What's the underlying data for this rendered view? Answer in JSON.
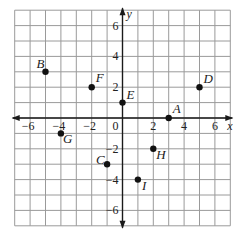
{
  "chart_data": {
    "type": "scatter",
    "title": "",
    "xlabel": "x",
    "ylabel": "y",
    "xlim": [
      -7,
      7
    ],
    "ylim": [
      -7,
      7
    ],
    "grid": true,
    "x_ticks": [
      -6,
      -4,
      -2,
      0,
      2,
      4,
      6
    ],
    "y_ticks": [
      6,
      4,
      2,
      -2,
      -4,
      -6
    ],
    "points": [
      {
        "label": "A",
        "x": 3,
        "y": 0,
        "label_dx": 4,
        "label_dy": -5
      },
      {
        "label": "B",
        "x": -5,
        "y": 3,
        "label_dx": -9,
        "label_dy": -4
      },
      {
        "label": "C",
        "x": -1,
        "y": -3,
        "label_dx": -11,
        "label_dy": 0
      },
      {
        "label": "D",
        "x": 5,
        "y": 2,
        "label_dx": 4,
        "label_dy": -4
      },
      {
        "label": "E",
        "x": 0,
        "y": 1,
        "label_dx": 4,
        "label_dy": -4
      },
      {
        "label": "F",
        "x": -2,
        "y": 2,
        "label_dx": 4,
        "label_dy": -5
      },
      {
        "label": "G",
        "x": -4,
        "y": -1,
        "label_dx": 2,
        "label_dy": 10
      },
      {
        "label": "H",
        "x": 2,
        "y": -2,
        "label_dx": 3,
        "label_dy": 10
      },
      {
        "label": "I",
        "x": 1,
        "y": -4,
        "label_dx": 4,
        "label_dy": 10
      }
    ]
  },
  "labels": {
    "x_axis": "x",
    "y_axis": "y",
    "origin": "0"
  }
}
